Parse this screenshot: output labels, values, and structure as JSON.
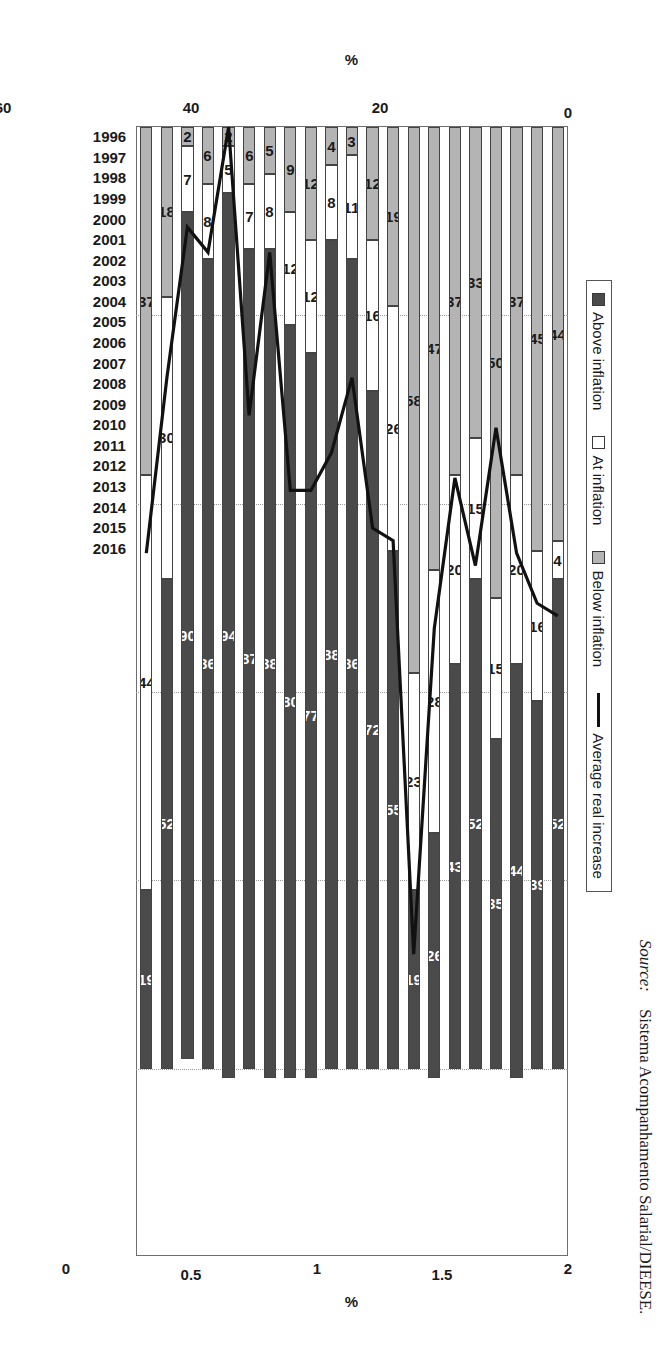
{
  "figure": {
    "source_label": "Source:",
    "source_text": "Sistema Acompanhamento Salarial/DIEESE.",
    "primary_axis_title": "%",
    "secondary_axis_title": "%"
  },
  "legend": {
    "items": [
      {
        "label": "Above inflation",
        "marker": "square-dark-swatch",
        "color": "#4a4a4a"
      },
      {
        "label": "At inflation",
        "marker": "square-white-swatch",
        "color": "#ffffff"
      },
      {
        "label": "Below inflation",
        "marker": "square-gray-swatch",
        "color": "#b4b4b4"
      },
      {
        "label": "Average real increase",
        "marker": "line-swatch",
        "color": "#111111"
      }
    ]
  },
  "chart_data": {
    "type": "bar",
    "title": "",
    "subtitle": "",
    "xlabel": "",
    "ylabel": "%",
    "y2label": "%",
    "orientation": "vertical-stacked-100",
    "grid": true,
    "legend_position": "top-center",
    "categories": [
      "1996",
      "1997",
      "1998",
      "1999",
      "2000",
      "2001",
      "2002",
      "2003",
      "2004",
      "2005",
      "2006",
      "2007",
      "2008",
      "2009",
      "2010",
      "2011",
      "2012",
      "2013",
      "2014",
      "2015",
      "2016"
    ],
    "ylim": [
      0,
      120
    ],
    "yticks": [
      0,
      20,
      40,
      60,
      80,
      100,
      120
    ],
    "y2lim": [
      -2.5,
      2
    ],
    "y2ticks": [
      2,
      1.5,
      1,
      0.5,
      0,
      -0.5,
      -1,
      -1.5,
      -2,
      -2.5
    ],
    "series": [
      {
        "name": "Above inflation",
        "axis": "left",
        "color": "#4a4a4a",
        "values": [
          52,
          39,
          44,
          35,
          52,
          43,
          26,
          19,
          55,
          72,
          86,
          88,
          77,
          80,
          88,
          87,
          94,
          86,
          90,
          52,
          19
        ]
      },
      {
        "name": "At inflation",
        "axis": "left",
        "color": "#ffffff",
        "values": [
          4,
          16,
          20,
          15,
          15,
          20,
          28,
          23,
          26,
          16,
          11,
          8,
          12,
          12,
          8,
          7,
          5,
          8,
          7,
          30,
          44
        ]
      },
      {
        "name": "Below inflation",
        "axis": "left",
        "color": "#b4b4b4",
        "values": [
          44,
          45,
          37,
          50,
          33,
          37,
          47,
          58,
          19,
          12,
          3,
          4,
          12,
          9,
          5,
          6,
          2,
          6,
          2,
          18,
          37
        ]
      },
      {
        "name": "Average real increase",
        "axis": "right",
        "type": "line",
        "color": "#111111",
        "values": [
          0.05,
          0.1,
          0.3,
          0.8,
          0.25,
          0.6,
          0.0,
          -1.3,
          0.35,
          0.4,
          1.0,
          0.7,
          0.55,
          0.55,
          1.5,
          0.85,
          2.0,
          1.5,
          1.6,
          1.0,
          0.3
        ]
      }
    ]
  }
}
